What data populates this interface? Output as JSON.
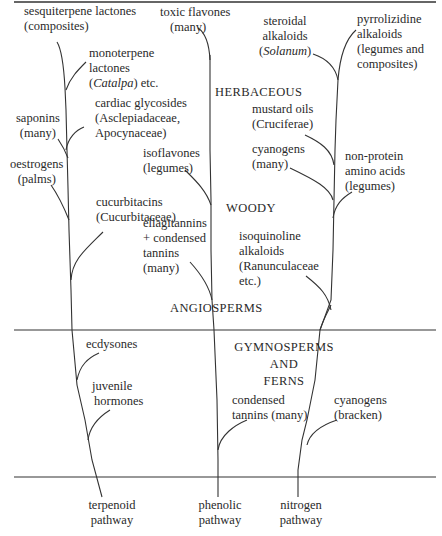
{
  "diagram": {
    "type": "phylogenetic-style pathway tree",
    "sections": {
      "herbaceous": "HERBACEOUS",
      "woody": "WOODY",
      "angiosperms": "ANGIOSPERMS",
      "gymnosperms_l1": "GYMNOSPERMS",
      "gymnosperms_l2": "AND",
      "gymnosperms_l3": "FERNS"
    },
    "pathways": {
      "terpenoid": {
        "l1": "terpenoid",
        "l2": "pathway"
      },
      "phenolic": {
        "l1": "phenolic",
        "l2": "pathway"
      },
      "nitrogen": {
        "l1": "nitrogen",
        "l2": "pathway"
      }
    },
    "terpenoid_branch": {
      "sesquiterpene": {
        "l1": "sesquiterpene lactones",
        "l2": "(composites)"
      },
      "monoterpene": {
        "l1": "monoterpene",
        "l2": "lactones",
        "l3_italic": "Catalpa",
        "l3_rest": ") etc.",
        "l3_open": "("
      },
      "saponins": {
        "l1": "saponins",
        "l2": "(many)"
      },
      "cardiac": {
        "l1": "cardiac glycosides",
        "l2": "(Asclepiadaceae,",
        "l3": "Apocynaceae)"
      },
      "oestrogens": {
        "l1": "oestrogens",
        "l2": "(palms)"
      },
      "cucurbitacins": {
        "l1": "cucurbitacins",
        "l2": "(Cucurbitaceae)"
      },
      "ecdysones": {
        "l1": "ecdysones"
      },
      "juvenile": {
        "l1": "juvenile",
        "l2": "hormones"
      }
    },
    "phenolic_branch": {
      "toxic_flavones": {
        "l1": "toxic flavones",
        "l2": "(many)"
      },
      "isoflavones": {
        "l1": "isoflavones",
        "l2": "(legumes)"
      },
      "ellagitannins": {
        "l1": "ellagitannins",
        "l2": "+ condensed",
        "l3": "tannins",
        "l4": "(many)"
      },
      "condensed_tannins": {
        "l1": "condensed",
        "l2": "tannins (many)"
      }
    },
    "nitrogen_branch": {
      "steroidal": {
        "l1": "steroidal",
        "l2": "alkaloids",
        "l3_open": "(",
        "l3_italic": "Solanum",
        "l3_close": ")"
      },
      "pyrrolizidine": {
        "l1": "pyrrolizidine",
        "l2": "alkaloids",
        "l3": "(legumes and",
        "l4": "composites)"
      },
      "mustard": {
        "l1": "mustard oils",
        "l2": "(Cruciferae)"
      },
      "cyanogens_many": {
        "l1": "cyanogens",
        "l2": "(many)"
      },
      "non_protein": {
        "l1": "non-protein",
        "l2": "amino acids",
        "l3": "(legumes)"
      },
      "isoquinoline": {
        "l1": "isoquinoline",
        "l2": "alkaloids",
        "l3": "(Ranunculaceae",
        "l4": "etc.)"
      },
      "cyanogens_bracken": {
        "l1": "cyanogens",
        "l2": "(bracken)"
      }
    }
  }
}
